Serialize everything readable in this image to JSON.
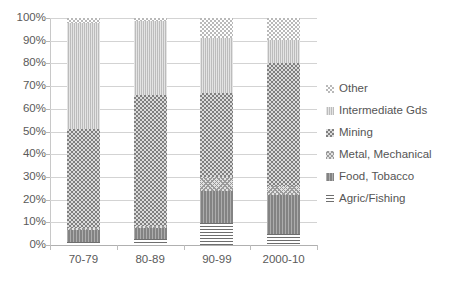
{
  "chart_data": {
    "type": "bar",
    "subtype": "stacked-100-percent",
    "title": "",
    "xlabel": "",
    "ylabel": "",
    "categories": [
      "70-79",
      "80-89",
      "90-99",
      "2000-10"
    ],
    "ylim": [
      0,
      100
    ],
    "ytick_labels": [
      "0%",
      "10%",
      "20%",
      "30%",
      "40%",
      "50%",
      "60%",
      "70%",
      "80%",
      "90%",
      "100%"
    ],
    "ytick_values": [
      0,
      10,
      20,
      30,
      40,
      50,
      60,
      70,
      80,
      90,
      100
    ],
    "grid": true,
    "legend_position": "right",
    "series": [
      {
        "name": "Agric/Fishing",
        "pattern": "horizontal-lines",
        "color": "#6e6e6e",
        "values": [
          1.5,
          2.5,
          9.5,
          5.0
        ]
      },
      {
        "name": "Food, Tobacco",
        "pattern": "vertical-lines",
        "color": "#8a8a8a",
        "values": [
          5.0,
          5.0,
          14.5,
          17.0
        ]
      },
      {
        "name": "Metal, Mechanical",
        "pattern": "crosshatch",
        "color": "#e2e2e2",
        "values": [
          1.0,
          1.0,
          6.0,
          4.0
        ]
      },
      {
        "name": "Mining",
        "pattern": "dotted-dark",
        "color": "#7f7f7f",
        "values": [
          43.5,
          57.5,
          37.0,
          54.0
        ]
      },
      {
        "name": "Intermediate Gds",
        "pattern": "light-solid",
        "color": "#c4c4c4",
        "values": [
          47.0,
          32.5,
          24.0,
          10.5
        ]
      },
      {
        "name": "Other",
        "pattern": "dotted-light",
        "color": "#ffffff",
        "values": [
          2.0,
          1.5,
          9.0,
          9.5
        ]
      }
    ]
  },
  "legend": {
    "items": [
      {
        "label": "Other"
      },
      {
        "label": "Intermediate Gds"
      },
      {
        "label": "Mining"
      },
      {
        "label": "Metal, Mechanical"
      },
      {
        "label": "Food, Tobacco"
      },
      {
        "label": "Agric/Fishing"
      }
    ]
  }
}
